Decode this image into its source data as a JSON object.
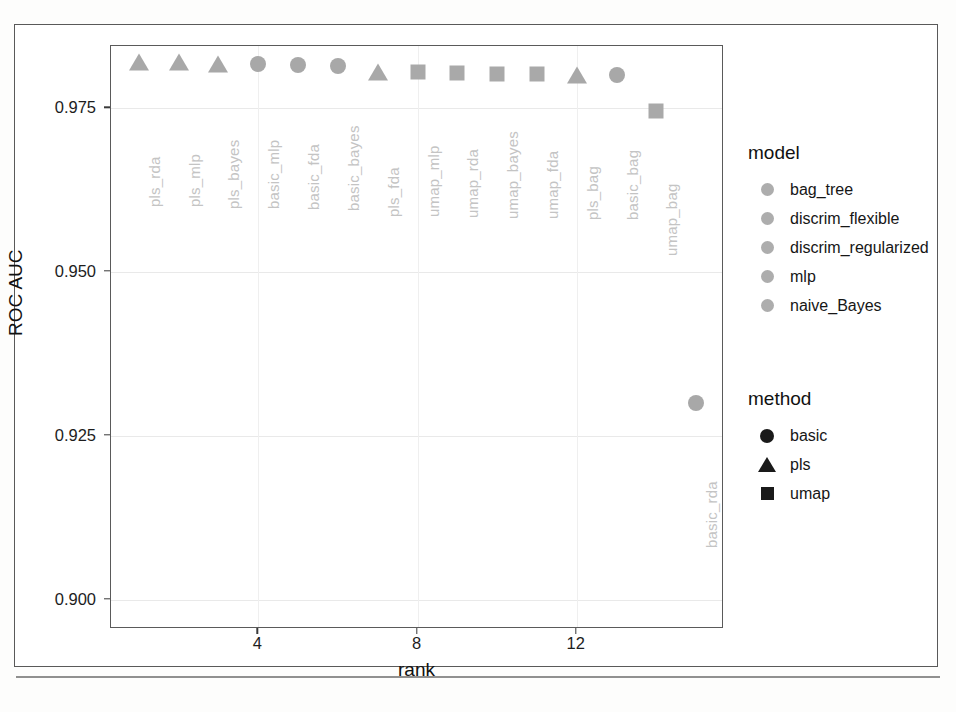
{
  "chart_data": {
    "type": "scatter",
    "title": "",
    "xlabel": "rank",
    "ylabel": "ROC AUC",
    "xlim": [
      0.3,
      15.7
    ],
    "ylim": [
      0.8955,
      0.9845
    ],
    "xticks": [
      4,
      8,
      12
    ],
    "xtick_labels": [
      "4",
      "8",
      "12"
    ],
    "yticks": [
      0.9,
      0.925,
      0.95,
      0.975
    ],
    "ytick_labels": [
      "0.900",
      "0.925",
      "0.950",
      "0.975"
    ],
    "grid": true,
    "legend_position": "right",
    "points": [
      {
        "label": "pls_rda",
        "rank": 1,
        "roc_auc": 0.982,
        "method": "pls",
        "marker": "triangle",
        "model": "discrim_regularized"
      },
      {
        "label": "pls_mlp",
        "rank": 2,
        "roc_auc": 0.982,
        "method": "pls",
        "marker": "triangle",
        "model": "mlp"
      },
      {
        "label": "pls_bayes",
        "rank": 3,
        "roc_auc": 0.9818,
        "method": "pls",
        "marker": "triangle",
        "model": "naive_Bayes"
      },
      {
        "label": "basic_mlp",
        "rank": 4,
        "roc_auc": 0.9817,
        "method": "basic",
        "marker": "circle",
        "model": "mlp"
      },
      {
        "label": "basic_fda",
        "rank": 5,
        "roc_auc": 0.9816,
        "method": "basic",
        "marker": "circle",
        "model": "discrim_flexible"
      },
      {
        "label": "basic_bayes",
        "rank": 6,
        "roc_auc": 0.9814,
        "method": "basic",
        "marker": "circle",
        "model": "naive_Bayes"
      },
      {
        "label": "pls_fda",
        "rank": 7,
        "roc_auc": 0.9806,
        "method": "pls",
        "marker": "triangle",
        "model": "discrim_flexible"
      },
      {
        "label": "umap_mlp",
        "rank": 8,
        "roc_auc": 0.9805,
        "method": "umap",
        "marker": "square",
        "model": "mlp"
      },
      {
        "label": "umap_rda",
        "rank": 9,
        "roc_auc": 0.9804,
        "method": "umap",
        "marker": "square",
        "model": "discrim_regularized"
      },
      {
        "label": "umap_bayes",
        "rank": 10,
        "roc_auc": 0.9803,
        "method": "umap",
        "marker": "square",
        "model": "naive_Bayes"
      },
      {
        "label": "umap_fda",
        "rank": 11,
        "roc_auc": 0.9803,
        "method": "umap",
        "marker": "square",
        "model": "discrim_flexible"
      },
      {
        "label": "pls_bag",
        "rank": 12,
        "roc_auc": 0.9801,
        "method": "pls",
        "marker": "triangle",
        "model": "bag_tree"
      },
      {
        "label": "basic_bag",
        "rank": 13,
        "roc_auc": 0.98,
        "method": "basic",
        "marker": "circle",
        "model": "bag_tree"
      },
      {
        "label": "umap_bag",
        "rank": 14,
        "roc_auc": 0.9746,
        "method": "umap",
        "marker": "square",
        "model": "bag_tree"
      },
      {
        "label": "basic_rda",
        "rank": 15,
        "roc_auc": 0.93,
        "method": "basic",
        "marker": "circle",
        "model": "discrim_regularized"
      }
    ]
  },
  "legends": {
    "model": {
      "title": "model",
      "items": [
        {
          "label": "bag_tree",
          "key": "circle-grey"
        },
        {
          "label": "discrim_flexible",
          "key": "circle-grey"
        },
        {
          "label": "discrim_regularized",
          "key": "circle-grey"
        },
        {
          "label": "mlp",
          "key": "circle-grey"
        },
        {
          "label": "naive_Bayes",
          "key": "circle-grey"
        }
      ]
    },
    "method": {
      "title": "method",
      "items": [
        {
          "label": "basic",
          "key": "circle-black"
        },
        {
          "label": "pls",
          "key": "triangle-black"
        },
        {
          "label": "umap",
          "key": "square-black"
        }
      ]
    }
  },
  "colors": {
    "marker_grey": "#a8a8a8",
    "label_grey": "#c4c4c4",
    "axis_black": "#1d1d1d",
    "grid_grey": "#e9e9e9",
    "panel_border": "#5a5a5a",
    "page_border": "#595959"
  }
}
